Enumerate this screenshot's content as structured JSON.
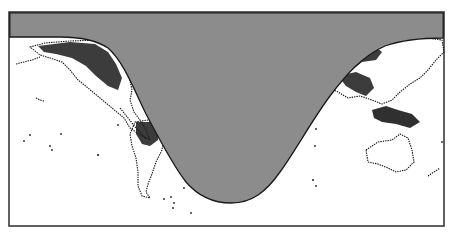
{
  "map": {
    "type": "world-map-day-night-terminator",
    "projection": "equirectangular",
    "frame": {
      "x": 9,
      "y": 12,
      "width": 435,
      "height": 214
    },
    "colors": {
      "night_shade": "#8c8c8c",
      "day": "#ffffff",
      "terminator_line": "#1a1a1a",
      "coastline": "#111111",
      "frame_border": "#3a3a3a"
    },
    "terminator": {
      "left_edge_y": 37,
      "right_edge_y": 38,
      "lowest_point": {
        "x": 231,
        "y": 203
      }
    },
    "regions_visible_in_daylight": [
      "North America",
      "Central America",
      "South America",
      "Europe",
      "Asia",
      "Southeast Asia",
      "Australia",
      "New Zealand",
      "Pacific Islands"
    ]
  }
}
